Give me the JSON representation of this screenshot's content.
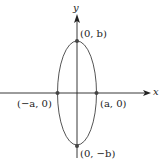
{
  "diagram": {
    "type": "ellipse-on-axes",
    "axes": {
      "x_label": "x",
      "y_label": "y"
    },
    "points": [
      {
        "id": "top",
        "label": "(0, b)"
      },
      {
        "id": "bottom",
        "label": "(0, −b)"
      },
      {
        "id": "left",
        "label": "(−a, 0)"
      },
      {
        "id": "right",
        "label": "(a, 0)"
      }
    ],
    "colors": {
      "axis": "#222222",
      "ellipse": "#555555",
      "point": "#444444"
    }
  }
}
